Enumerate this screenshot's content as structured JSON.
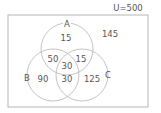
{
  "universe": {
    "label": "U=500"
  },
  "sets": {
    "A": {
      "label": "A"
    },
    "B": {
      "label": "B"
    },
    "C": {
      "label": "C"
    }
  },
  "regions": {
    "a_only": "15",
    "outside": "145",
    "a_b_only": "50",
    "a_c_only": "15",
    "a_b_c": "30",
    "b_only": "90",
    "b_c_only": "30",
    "c_only": "125"
  },
  "colors": {
    "stroke": "#b0b0b0",
    "text": "#555555",
    "background": "#ffffff"
  }
}
